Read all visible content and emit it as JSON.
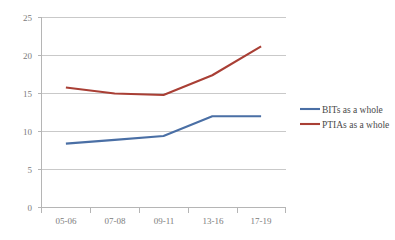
{
  "chart_data": {
    "type": "line",
    "title": "",
    "xlabel": "",
    "ylabel": "",
    "categories": [
      "05-06",
      "07-08",
      "09-11",
      "13-16",
      "17-19"
    ],
    "ylim": [
      0,
      25
    ],
    "yticks": [
      0,
      5,
      10,
      15,
      20,
      25
    ],
    "grid": true,
    "legend_position": "right",
    "series": [
      {
        "name": "BITs as a whole",
        "color": "#4a6fa5",
        "values": [
          8.4,
          8.9,
          9.4,
          12.0,
          12.0
        ]
      },
      {
        "name": "PTIAs as a whole",
        "color": "#a93f35",
        "values": [
          15.8,
          15.0,
          14.8,
          17.4,
          21.2
        ]
      }
    ]
  },
  "axes": {
    "y_tick_labels": [
      "0",
      "5",
      "10",
      "15",
      "20",
      "25"
    ],
    "x_tick_labels": [
      "05-06",
      "07-08",
      "09-11",
      "13-16",
      "17-19"
    ]
  },
  "legend": {
    "items": [
      {
        "label": "BITs as a whole",
        "color": "#4a6fa5"
      },
      {
        "label": "PTIAs as a whole",
        "color": "#a93f35"
      }
    ]
  }
}
